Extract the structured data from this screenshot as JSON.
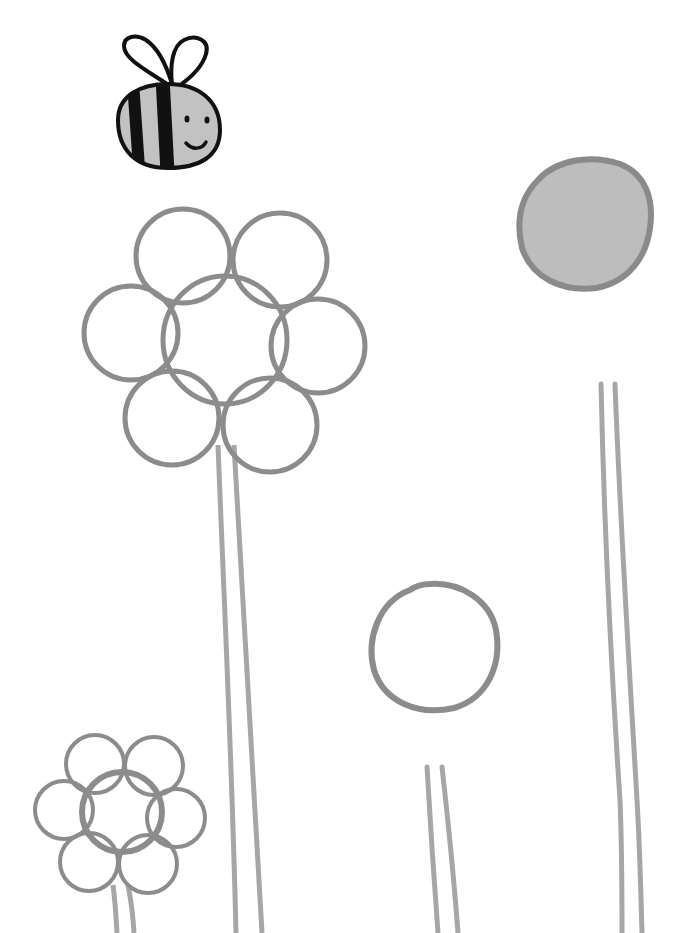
{
  "page": {
    "type": "coloring-page",
    "background": "#ffffff",
    "stroke_color": "#8c8c8c",
    "fill_gray": "#bdbdbd",
    "ink_color": "#111111"
  },
  "bee": {
    "body_fill": "#c2c2c2",
    "ink": "#111111"
  },
  "lollipop_flowers": [
    {
      "name": "filled-round-flower",
      "fill": "#bdbdbd"
    },
    {
      "name": "empty-round-flower",
      "fill": "#ffffff"
    }
  ],
  "petal_flowers": [
    {
      "name": "large-petal-flower",
      "petals": 6
    },
    {
      "name": "small-petal-flower",
      "petals": 6
    }
  ]
}
